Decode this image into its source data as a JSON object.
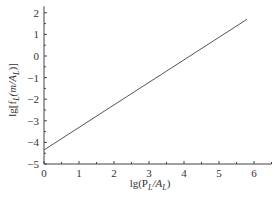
{
  "chart_data": {
    "type": "line",
    "title": "",
    "xlabel": "lg(P_L/A_L)",
    "ylabel": "lg[f_L(m/A_L)]",
    "xlim": [
      0,
      6.5
    ],
    "ylim": [
      -5,
      2.3
    ],
    "x_ticks": [
      0,
      1,
      2,
      3,
      4,
      5,
      6
    ],
    "y_ticks": [
      -5,
      -4,
      -3,
      -2,
      -1,
      0,
      1,
      2
    ],
    "grid": false,
    "legend": null,
    "series": [
      {
        "name": "fit",
        "x": [
          0,
          5.8
        ],
        "y": [
          -4.35,
          1.7
        ]
      }
    ]
  },
  "labels": {
    "x_axis": "lg(P",
    "x_sub1": "L",
    "x_mid": "/A",
    "x_sub2": "L",
    "x_end": ")",
    "y_axis": "lg[f",
    "y_sub1": "L",
    "y_mid": "(m/A",
    "y_sub2": "L",
    "y_end": ")]"
  }
}
